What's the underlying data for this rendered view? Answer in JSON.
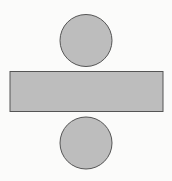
{
  "diagram": {
    "type": "cylinder-net",
    "background": "#fbfbfa",
    "fill": "#bdbdbd",
    "stroke": "#555555",
    "shapes": {
      "top_circle": {
        "cx": 86,
        "cy": 40.5,
        "r": 26
      },
      "rectangle": {
        "x": 10,
        "y": 71.5,
        "width": 153,
        "height": 40
      },
      "bottom_circle": {
        "cx": 86,
        "cy": 143,
        "r": 26
      }
    }
  }
}
